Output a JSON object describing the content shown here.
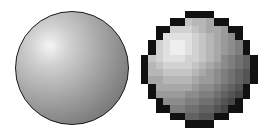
{
  "illustration": {
    "subject": "Smooth rendered sphere vs pixelated (rasterized) sphere",
    "left": {
      "label": "smooth-sphere",
      "style": "anti-aliased gradient shaded circle with dark outline"
    },
    "right": {
      "label": "pixel-sphere",
      "style": "low-resolution pixel-art sphere",
      "grid_cells": 16
    },
    "colors": {
      "outline": "#111111",
      "highlight": "#f6f6f6",
      "mid": "#a0a0a0",
      "shadow": "#555555",
      "background": "#ffffff"
    }
  }
}
